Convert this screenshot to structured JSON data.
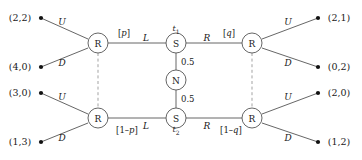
{
  "figure": {
    "type": "extensive-form-game-tree",
    "width": 362,
    "height": 160,
    "background": "#ffffff",
    "line_color": "#555555",
    "text_color": "#1a1a1a",
    "dashed_color": "#999999"
  },
  "nodes": [
    {
      "id": "R1",
      "label": "R",
      "kind": "player-R",
      "x": 98,
      "y": 43
    },
    {
      "id": "R2",
      "label": "R",
      "kind": "player-R",
      "x": 98,
      "y": 118
    },
    {
      "id": "S1",
      "label": "S",
      "kind": "player-S",
      "x": 176,
      "y": 43
    },
    {
      "id": "S2",
      "label": "S",
      "kind": "player-S",
      "x": 176,
      "y": 118
    },
    {
      "id": "N",
      "label": "N",
      "kind": "chance",
      "x": 176,
      "y": 80
    },
    {
      "id": "R3",
      "label": "R",
      "kind": "player-R",
      "x": 252,
      "y": 43
    },
    {
      "id": "R4",
      "label": "R",
      "kind": "player-R",
      "x": 252,
      "y": 118
    }
  ],
  "node_names": {
    "R1": "node-R-top-left",
    "R2": "node-R-bottom-left",
    "S1": "node-S-t1",
    "S2": "node-S-t2",
    "N": "node-N-chance",
    "R3": "node-R-top-right",
    "R4": "node-R-bottom-right"
  },
  "type_labels": [
    {
      "id": "t1",
      "text": "t",
      "sub": "1",
      "x": 176,
      "y": 30
    },
    {
      "id": "t2",
      "text": "t",
      "sub": "2",
      "x": 176,
      "y": 131
    }
  ],
  "action_labels": [
    {
      "id": "U-topleft",
      "text": "U",
      "x": 62,
      "y": 22
    },
    {
      "id": "D-topleft",
      "text": "D",
      "x": 62,
      "y": 63
    },
    {
      "id": "U-bottomleft",
      "text": "U",
      "x": 62,
      "y": 97
    },
    {
      "id": "D-bottomleft",
      "text": "D",
      "x": 62,
      "y": 138
    },
    {
      "id": "L-top",
      "text": "L",
      "x": 146,
      "y": 38
    },
    {
      "id": "R-top",
      "text": "R",
      "x": 207,
      "y": 38
    },
    {
      "id": "L-bottom",
      "text": "L",
      "x": 146,
      "y": 126
    },
    {
      "id": "R-bottom",
      "text": "R",
      "x": 207,
      "y": 126
    },
    {
      "id": "U-topright",
      "text": "U",
      "x": 288,
      "y": 22
    },
    {
      "id": "D-topright",
      "text": "D",
      "x": 288,
      "y": 63
    },
    {
      "id": "U-bottomright",
      "text": "U",
      "x": 288,
      "y": 97
    },
    {
      "id": "D-bottomright",
      "text": "D",
      "x": 288,
      "y": 138
    }
  ],
  "belief_labels": [
    {
      "id": "p",
      "prefix": "[",
      "italic": "p",
      "suffix": "]",
      "x": 124,
      "y": 33
    },
    {
      "id": "q",
      "prefix": "[",
      "italic": "q",
      "suffix": "]",
      "x": 229,
      "y": 33
    },
    {
      "id": "one-minus-p",
      "prefix": "[1–",
      "italic": "p",
      "suffix": "]",
      "x": 127,
      "y": 130
    },
    {
      "id": "one-minus-q",
      "prefix": "[1–",
      "italic": "q",
      "suffix": "]",
      "x": 231,
      "y": 130
    }
  ],
  "chance_probabilities": [
    {
      "id": "prob-upper",
      "text": "0.5",
      "x": 181,
      "y": 62
    },
    {
      "id": "prob-lower",
      "text": "0.5",
      "x": 181,
      "y": 99
    }
  ],
  "payoffs_left": [
    {
      "id": "payoff-2-2",
      "text": "(2,2)",
      "label_x": 20,
      "label_y": 18,
      "dot_x": 41,
      "dot_y": 18
    },
    {
      "id": "payoff-4-0",
      "text": "(4,0)",
      "label_x": 20,
      "label_y": 67,
      "dot_x": 41,
      "dot_y": 67
    },
    {
      "id": "payoff-3-0",
      "text": "(3,0)",
      "label_x": 20,
      "label_y": 93,
      "dot_x": 41,
      "dot_y": 93
    },
    {
      "id": "payoff-1-3",
      "text": "(1,3)",
      "label_x": 20,
      "label_y": 142,
      "dot_x": 41,
      "dot_y": 142
    }
  ],
  "payoffs_right": [
    {
      "id": "payoff-2-1",
      "text": "(2,1)",
      "label_x": 339,
      "label_y": 18,
      "dot_x": 318,
      "dot_y": 18
    },
    {
      "id": "payoff-0-2",
      "text": "(0,2)",
      "label_x": 339,
      "label_y": 67,
      "dot_x": 318,
      "dot_y": 67
    },
    {
      "id": "payoff-2-0",
      "text": "(2,0)",
      "label_x": 339,
      "label_y": 93,
      "dot_x": 318,
      "dot_y": 93
    },
    {
      "id": "payoff-1-2",
      "text": "(1,2)",
      "label_x": 339,
      "label_y": 142,
      "dot_x": 318,
      "dot_y": 142
    }
  ],
  "solid_edges": [
    {
      "id": "edge-R1-U",
      "x1": 41,
      "y1": 18,
      "x2": 88,
      "y2": 39
    },
    {
      "id": "edge-R1-D",
      "x1": 41,
      "y1": 67,
      "x2": 88,
      "y2": 48
    },
    {
      "id": "edge-R2-U",
      "x1": 41,
      "y1": 93,
      "x2": 88,
      "y2": 114
    },
    {
      "id": "edge-R2-D",
      "x1": 41,
      "y1": 142,
      "x2": 88,
      "y2": 123
    },
    {
      "id": "edge-R1-S1",
      "x1": 108,
      "y1": 43,
      "x2": 166,
      "y2": 43
    },
    {
      "id": "edge-S1-R3",
      "x1": 186,
      "y1": 43,
      "x2": 242,
      "y2": 43
    },
    {
      "id": "edge-R2-S2",
      "x1": 108,
      "y1": 118,
      "x2": 166,
      "y2": 118
    },
    {
      "id": "edge-S2-R4",
      "x1": 186,
      "y1": 118,
      "x2": 242,
      "y2": 118
    },
    {
      "id": "edge-S1-N",
      "x1": 176,
      "y1": 53,
      "x2": 176,
      "y2": 70
    },
    {
      "id": "edge-N-S2",
      "x1": 176,
      "y1": 90,
      "x2": 176,
      "y2": 108
    },
    {
      "id": "edge-R3-U",
      "x1": 262,
      "y1": 39,
      "x2": 318,
      "y2": 18
    },
    {
      "id": "edge-R3-D",
      "x1": 262,
      "y1": 48,
      "x2": 318,
      "y2": 67
    },
    {
      "id": "edge-R4-U",
      "x1": 262,
      "y1": 114,
      "x2": 318,
      "y2": 93
    },
    {
      "id": "edge-R4-D",
      "x1": 262,
      "y1": 123,
      "x2": 318,
      "y2": 142
    }
  ],
  "dashed_edges": [
    {
      "id": "infoset-left",
      "x1": 98,
      "y1": 53,
      "x2": 98,
      "y2": 108
    },
    {
      "id": "infoset-right",
      "x1": 252,
      "y1": 53,
      "x2": 252,
      "y2": 108
    }
  ]
}
